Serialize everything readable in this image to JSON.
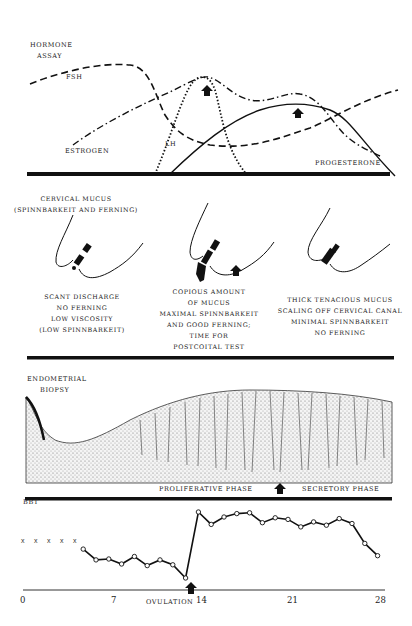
{
  "hormone_assay": {
    "title_line1": "HORMONE",
    "title_line2": "ASSAY",
    "labels": {
      "fsh": "FSH",
      "estrogen": "ESTROGEN",
      "lh": "LH",
      "progesterone": "PROGESTERONE"
    }
  },
  "cervical_mucus": {
    "title_line1": "CERVICAL MUCUS",
    "title_line2": "(SPINNBARKEIT AND FERNING)",
    "stages": [
      {
        "lines": [
          "SCANT DISCHARGE",
          "NO FERNING",
          "LOW VISCOSITY",
          "(LOW SPINNBARKEIT)"
        ]
      },
      {
        "lines": [
          "COPIOUS AMOUNT",
          "OF MUCUS",
          "MAXIMAL SPINNBARKEIT",
          "AND GOOD FERNING;",
          "TIME FOR",
          "POSTCOITAL TEST"
        ]
      },
      {
        "lines": [
          "THICK TENACIOUS MUCUS",
          "SCALING OFF CERVICAL CANAL",
          "MINIMAL SPINNBARKEIT",
          "NO FERNING"
        ]
      }
    ]
  },
  "endometrial_biopsy": {
    "title_line1": "ENDOMETRIAL",
    "title_line2": "BIOPSY",
    "phase_left": "PROLIFERATIVE PHASE",
    "phase_right": "SECRETORY PHASE"
  },
  "bbt": {
    "title": "BBT",
    "x_ticks": [
      "0",
      "7",
      "14",
      "21",
      "28"
    ],
    "ovulation_label": "OVULATION"
  },
  "chart_data": {
    "type": "line",
    "title": "BBT",
    "xlabel": "Cycle day",
    "ylabel": "Basal body temperature (relative)",
    "x_ticks": [
      0,
      7,
      14,
      21,
      28
    ],
    "annotations": [
      "OVULATION at day 14 (arrow)"
    ],
    "unrecorded_days_marked_x": [
      1,
      2,
      3,
      4,
      5
    ],
    "series": [
      {
        "name": "BBT",
        "x": [
          5,
          6,
          7,
          8,
          9,
          10,
          11,
          12,
          13,
          14,
          15,
          16,
          17,
          18,
          19,
          20,
          21,
          22,
          23,
          24,
          25,
          26,
          27,
          28
        ],
        "y": [
          0.55,
          0.42,
          0.43,
          0.37,
          0.46,
          0.35,
          0.42,
          0.36,
          0.2,
          1.0,
          0.85,
          0.94,
          0.98,
          0.99,
          0.87,
          0.93,
          0.91,
          0.82,
          0.88,
          0.84,
          0.92,
          0.86,
          0.62,
          0.47
        ]
      }
    ],
    "grid": false
  }
}
